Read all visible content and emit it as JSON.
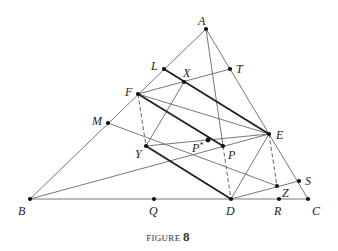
{
  "caption": {
    "text": "FIGURE",
    "number": "8"
  },
  "colors": {
    "line": "#555555",
    "thick": "#222222",
    "point": "#111111",
    "text": "#222222"
  },
  "points": [
    {
      "id": "A",
      "label": "A",
      "x": 206,
      "y": 29,
      "lx": -8,
      "ly": -4
    },
    {
      "id": "B",
      "label": "B",
      "x": 30,
      "y": 199,
      "lx": -12,
      "ly": 16
    },
    {
      "id": "C",
      "label": "C",
      "x": 308,
      "y": 199,
      "lx": 4,
      "ly": 16
    },
    {
      "id": "D",
      "label": "D",
      "x": 231,
      "y": 199,
      "lx": -5,
      "ly": 16
    },
    {
      "id": "E",
      "label": "E",
      "x": 269,
      "y": 134,
      "lx": 7,
      "ly": 5
    },
    {
      "id": "F",
      "label": "F",
      "x": 138,
      "y": 94,
      "lx": -13,
      "ly": 2
    },
    {
      "id": "L",
      "label": "L",
      "x": 164,
      "y": 69,
      "lx": -13,
      "ly": 1
    },
    {
      "id": "M",
      "label": "M",
      "x": 108,
      "y": 123,
      "lx": -16,
      "ly": 2
    },
    {
      "id": "T",
      "label": "T",
      "x": 230,
      "y": 69,
      "lx": 6,
      "ly": 4
    },
    {
      "id": "X",
      "label": "X",
      "x": 184,
      "y": 82,
      "lx": -1,
      "ly": -5
    },
    {
      "id": "Y",
      "label": "Y",
      "x": 146,
      "y": 146,
      "lx": -11,
      "ly": 12
    },
    {
      "id": "P",
      "label": "P",
      "x": 223,
      "y": 146,
      "lx": 5,
      "ly": 13
    },
    {
      "id": "Pstar",
      "label": "P*",
      "x": 208,
      "y": 140,
      "lx": -16,
      "ly": 12
    },
    {
      "id": "Q",
      "label": "Q",
      "x": 154,
      "y": 199,
      "lx": -5,
      "ly": 16
    },
    {
      "id": "R",
      "label": "R",
      "x": 279,
      "y": 199,
      "lx": -5,
      "ly": 16
    },
    {
      "id": "S",
      "label": "S",
      "x": 299,
      "y": 181,
      "lx": 6,
      "ly": 4
    },
    {
      "id": "Z",
      "label": "Z",
      "x": 277,
      "y": 186,
      "lx": 5,
      "ly": 11
    }
  ],
  "segments": [
    {
      "from": "A",
      "to": "B",
      "style": "thin"
    },
    {
      "from": "A",
      "to": "C",
      "style": "thin"
    },
    {
      "from": "B",
      "to": "C",
      "style": "thin"
    },
    {
      "from": "A",
      "to": "P",
      "style": "thin"
    },
    {
      "from": "F",
      "to": "T",
      "style": "thin"
    },
    {
      "from": "F",
      "to": "E",
      "style": "thin"
    },
    {
      "from": "X",
      "to": "Y",
      "style": "thin"
    },
    {
      "from": "M",
      "to": "Z",
      "style": "thin"
    },
    {
      "from": "Y",
      "to": "E",
      "style": "thin"
    },
    {
      "from": "B",
      "to": "E",
      "style": "thin"
    },
    {
      "from": "D",
      "to": "E",
      "style": "thin"
    },
    {
      "from": "D",
      "to": "S",
      "style": "thin"
    },
    {
      "from": "L",
      "to": "E",
      "style": "thick"
    },
    {
      "from": "F",
      "to": "P",
      "style": "thick"
    },
    {
      "from": "Y",
      "to": "D",
      "style": "thick"
    },
    {
      "from": "F",
      "to": "Y",
      "style": "dashed"
    },
    {
      "from": "P",
      "to": "D",
      "style": "dashed"
    },
    {
      "from": "E",
      "to": "Z",
      "style": "dashed"
    }
  ]
}
